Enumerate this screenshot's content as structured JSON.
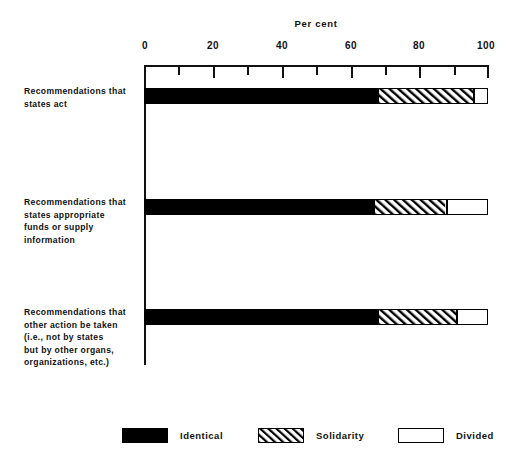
{
  "chart_data": {
    "type": "bar",
    "orientation": "horizontal",
    "stacked": true,
    "title": "",
    "xlabel": "Per cent",
    "ylabel": "",
    "xlim": [
      0,
      100
    ],
    "xticks": [
      0,
      20,
      40,
      60,
      80,
      100
    ],
    "xtick_labels": [
      "0",
      "20",
      "40",
      "60",
      "80",
      "100"
    ],
    "minor_tick_interval": 10,
    "grid": false,
    "legend_position": "bottom",
    "categories": [
      "Recommendations that states act",
      "Recommendations that states appropriate funds or supply information",
      "Recommendations that other action be taken (i.e., not by states but by other organs, organizations, etc.)"
    ],
    "category_label_lines": [
      [
        "Recommendations that",
        "states act"
      ],
      [
        "Recommendations that",
        "states appropriate",
        "funds or supply",
        "information"
      ],
      [
        "Recommendations that",
        "other action be taken",
        "(i.e., not by states",
        "but by other organs,",
        "organizations, etc.)"
      ]
    ],
    "series": [
      {
        "name": "Identical",
        "values": [
          68,
          67,
          68
        ]
      },
      {
        "name": "Solidarity",
        "values": [
          28,
          21,
          23
        ]
      },
      {
        "name": "Divided",
        "values": [
          4,
          12,
          9
        ]
      }
    ],
    "cumulative_boundaries": [
      [
        68,
        96,
        100
      ],
      [
        67,
        88,
        100
      ],
      [
        68,
        91,
        100
      ]
    ]
  },
  "legend": {
    "items": [
      {
        "label": "Identical",
        "pattern": "solid-black",
        "color": "#000000"
      },
      {
        "label": "Solidarity",
        "pattern": "diagonal-hatch",
        "color": "#ffffff"
      },
      {
        "label": "Divided",
        "pattern": "solid-white",
        "color": "#ffffff"
      }
    ]
  },
  "axis": {
    "title": "Per cent",
    "tick_labels": [
      "0",
      "20",
      "40",
      "60",
      "80",
      "100"
    ]
  },
  "colors": {
    "ink": "#111111",
    "identical": "#000000",
    "outline": "#000000",
    "background": "#ffffff"
  }
}
